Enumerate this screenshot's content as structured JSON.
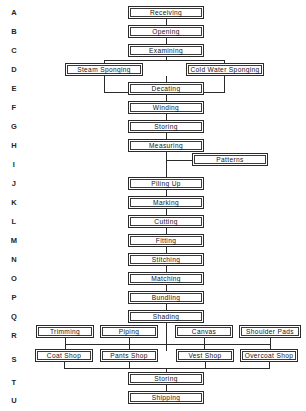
{
  "canvas": {
    "width": 306,
    "height": 411,
    "background": "#ffffff",
    "line_color": "#2b2b2b"
  },
  "row_labels": [
    {
      "id": "A",
      "label": "A",
      "y": 8
    },
    {
      "id": "B",
      "label": "B",
      "y": 27
    },
    {
      "id": "C",
      "label": "C",
      "y": 46
    },
    {
      "id": "D",
      "label": "D",
      "y": 65
    },
    {
      "id": "E",
      "label": "E",
      "y": 84
    },
    {
      "id": "F",
      "label": "F",
      "y": 103
    },
    {
      "id": "G",
      "label": "G",
      "y": 122
    },
    {
      "id": "H",
      "label": "H",
      "y": 141
    },
    {
      "id": "I",
      "label": "I",
      "y": 160
    },
    {
      "id": "J",
      "label": "J",
      "y": 179
    },
    {
      "id": "K",
      "label": "K",
      "y": 198
    },
    {
      "id": "L",
      "label": "L",
      "y": 217
    },
    {
      "id": "M",
      "label": "M",
      "y": 236
    },
    {
      "id": "N",
      "label": "N",
      "y": 255
    },
    {
      "id": "O",
      "label": "O",
      "y": 274
    },
    {
      "id": "P",
      "label": "P",
      "y": 293
    },
    {
      "id": "Q",
      "label": "Q",
      "y": 312
    },
    {
      "id": "R",
      "label": "R",
      "y": 331
    },
    {
      "id": "S",
      "label": "S",
      "y": 355
    },
    {
      "id": "T",
      "label": "T",
      "y": 378
    },
    {
      "id": "U",
      "label": "U",
      "y": 396
    }
  ],
  "nodes": [
    {
      "key": "receiving",
      "row": "A",
      "label": "Receiving",
      "x": 128,
      "y": 6,
      "w": 76
    },
    {
      "key": "opening",
      "row": "B",
      "label": "Opening",
      "x": 128,
      "y": 25,
      "w": 76
    },
    {
      "key": "examining",
      "row": "C",
      "label": "Examining",
      "x": 128,
      "y": 44,
      "w": 76
    },
    {
      "key": "steam_sponging",
      "row": "D",
      "label": "Steam Sponging",
      "x": 65,
      "y": 63,
      "w": 78
    },
    {
      "key": "cold_water_sponging",
      "row": "D",
      "label": "Cold Water Sponging",
      "x": 186,
      "y": 63,
      "w": 78
    },
    {
      "key": "decating",
      "row": "E",
      "label": "Decating",
      "x": 128,
      "y": 82,
      "w": 76
    },
    {
      "key": "winding",
      "row": "F",
      "label": "Winding",
      "x": 128,
      "y": 101,
      "w": 76
    },
    {
      "key": "storing_g",
      "row": "G",
      "label": "Storing",
      "x": 128,
      "y": 120,
      "w": 76
    },
    {
      "key": "measuring",
      "row": "H",
      "label": "Measuring",
      "x": 128,
      "y": 139,
      "w": 76
    },
    {
      "key": "patterns",
      "row": "I",
      "label": "Patterns",
      "x": 192,
      "y": 153,
      "w": 76
    },
    {
      "key": "piling_up",
      "row": "J",
      "label": "Piling Up",
      "x": 128,
      "y": 177,
      "w": 76
    },
    {
      "key": "marking",
      "row": "K",
      "label": "Marking",
      "x": 128,
      "y": 196,
      "w": 76
    },
    {
      "key": "cutting",
      "row": "L",
      "label": "Cutting",
      "x": 128,
      "y": 215,
      "w": 76
    },
    {
      "key": "fitting",
      "row": "M",
      "label": "Fitting",
      "x": 128,
      "y": 234,
      "w": 76
    },
    {
      "key": "stitching",
      "row": "N",
      "label": "Stitching",
      "x": 128,
      "y": 253,
      "w": 76
    },
    {
      "key": "matching",
      "row": "O",
      "label": "Matching",
      "x": 128,
      "y": 272,
      "w": 76
    },
    {
      "key": "bundling",
      "row": "P",
      "label": "Bundling",
      "x": 128,
      "y": 291,
      "w": 76
    },
    {
      "key": "shading",
      "row": "Q",
      "label": "Shading",
      "x": 128,
      "y": 310,
      "w": 76
    },
    {
      "key": "trimming",
      "row": "R",
      "label": "Trimming",
      "x": 36,
      "y": 325,
      "w": 58
    },
    {
      "key": "piping",
      "row": "R",
      "label": "Piping",
      "x": 100,
      "y": 325,
      "w": 58
    },
    {
      "key": "canvas",
      "row": "R",
      "label": "Canvas",
      "x": 175,
      "y": 325,
      "w": 58
    },
    {
      "key": "shoulder_pads",
      "row": "R",
      "label": "Shoulder Pads",
      "x": 239,
      "y": 325,
      "w": 62
    },
    {
      "key": "coat_shop",
      "row": "S",
      "label": "Coat Shop",
      "x": 35,
      "y": 349,
      "w": 58
    },
    {
      "key": "pants_shop",
      "row": "S",
      "label": "Pants Shop",
      "x": 100,
      "y": 349,
      "w": 58
    },
    {
      "key": "vest_shop",
      "row": "S",
      "label": "Vest Shop",
      "x": 176,
      "y": 349,
      "w": 58
    },
    {
      "key": "overcoat_shop",
      "row": "S",
      "label": "Overcoat Shop",
      "x": 240,
      "y": 349,
      "w": 58
    },
    {
      "key": "storing_t",
      "row": "T",
      "label": "Storing",
      "x": 128,
      "y": 372,
      "w": 76
    },
    {
      "key": "shipping",
      "row": "U",
      "label": "Shipping",
      "x": 128,
      "y": 391,
      "w": 76
    }
  ],
  "edges": [
    {
      "key": "a-b",
      "orient": "v",
      "x": 166,
      "y": 19,
      "len": 6
    },
    {
      "key": "b-c",
      "orient": "v",
      "x": 166,
      "y": 38,
      "len": 6
    },
    {
      "key": "c-bus-down",
      "orient": "v",
      "x": 166,
      "y": 57,
      "len": 4
    },
    {
      "key": "d-bus-top",
      "orient": "h",
      "x": 104,
      "y": 60,
      "len": 121
    },
    {
      "key": "d-left-drop",
      "orient": "v",
      "x": 104,
      "y": 60,
      "len": 4
    },
    {
      "key": "d-right-drop",
      "orient": "v",
      "x": 224,
      "y": 60,
      "len": 4
    },
    {
      "key": "d-left-under",
      "orient": "v",
      "x": 104,
      "y": 76,
      "len": 16
    },
    {
      "key": "d-right-under",
      "orient": "v",
      "x": 224,
      "y": 76,
      "len": 16
    },
    {
      "key": "e-bus-bottom",
      "orient": "h",
      "x": 104,
      "y": 92,
      "len": 121
    },
    {
      "key": "e-center-drop",
      "orient": "v",
      "x": 166,
      "y": 76,
      "len": 6
    },
    {
      "key": "e-to-f",
      "orient": "v",
      "x": 166,
      "y": 92,
      "len": 10
    },
    {
      "key": "f-g",
      "orient": "v",
      "x": 166,
      "y": 114,
      "len": 6
    },
    {
      "key": "g-h",
      "orient": "v",
      "x": 166,
      "y": 133,
      "len": 6
    },
    {
      "key": "h-i",
      "orient": "v",
      "x": 166,
      "y": 152,
      "len": 8
    },
    {
      "key": "i-patterns",
      "orient": "h",
      "x": 166,
      "y": 160,
      "len": 27
    },
    {
      "key": "i-j",
      "orient": "v",
      "x": 166,
      "y": 160,
      "len": 17
    },
    {
      "key": "j-k",
      "orient": "v",
      "x": 166,
      "y": 190,
      "len": 6
    },
    {
      "key": "k-l",
      "orient": "v",
      "x": 166,
      "y": 209,
      "len": 6
    },
    {
      "key": "l-m",
      "orient": "v",
      "x": 166,
      "y": 228,
      "len": 6
    },
    {
      "key": "m-n",
      "orient": "v",
      "x": 166,
      "y": 247,
      "len": 6
    },
    {
      "key": "n-o",
      "orient": "v",
      "x": 166,
      "y": 266,
      "len": 6
    },
    {
      "key": "o-p",
      "orient": "v",
      "x": 166,
      "y": 285,
      "len": 6
    },
    {
      "key": "p-q",
      "orient": "v",
      "x": 166,
      "y": 304,
      "len": 6
    },
    {
      "key": "q-down",
      "orient": "v",
      "x": 166,
      "y": 323,
      "len": 28
    },
    {
      "key": "r-trimming-drop",
      "orient": "v",
      "x": 65,
      "y": 338,
      "len": 6
    },
    {
      "key": "r-piping-drop",
      "orient": "v",
      "x": 129,
      "y": 338,
      "len": 6
    },
    {
      "key": "r-canvas-drop",
      "orient": "v",
      "x": 204,
      "y": 338,
      "len": 6
    },
    {
      "key": "r-pads-drop",
      "orient": "v",
      "x": 270,
      "y": 338,
      "len": 6
    },
    {
      "key": "r-bus",
      "orient": "h",
      "x": 65,
      "y": 344,
      "len": 206
    },
    {
      "key": "r-bus-to-s",
      "orient": "v",
      "x": 65,
      "y": 344,
      "len": 5
    },
    {
      "key": "s-coat-drop",
      "orient": "v",
      "x": 64,
      "y": 362,
      "len": 6
    },
    {
      "key": "s-pants-drop",
      "orient": "v",
      "x": 129,
      "y": 362,
      "len": 6
    },
    {
      "key": "s-vest-drop",
      "orient": "v",
      "x": 205,
      "y": 362,
      "len": 6
    },
    {
      "key": "s-overcoat-drop",
      "orient": "v",
      "x": 269,
      "y": 362,
      "len": 6
    },
    {
      "key": "s-bus",
      "orient": "h",
      "x": 64,
      "y": 368,
      "len": 206
    },
    {
      "key": "s-bus-to-t",
      "orient": "v",
      "x": 166,
      "y": 368,
      "len": 4
    },
    {
      "key": "t-u",
      "orient": "v",
      "x": 166,
      "y": 385,
      "len": 6
    },
    {
      "key": "r-bus-join-left",
      "orient": "v",
      "x": 204,
      "y": 344,
      "len": 5
    },
    {
      "key": "r-bus-join-right",
      "orient": "v",
      "x": 270,
      "y": 344,
      "len": 5
    },
    {
      "key": "r-bus-join-mid",
      "orient": "v",
      "x": 129,
      "y": 344,
      "len": 5
    }
  ]
}
